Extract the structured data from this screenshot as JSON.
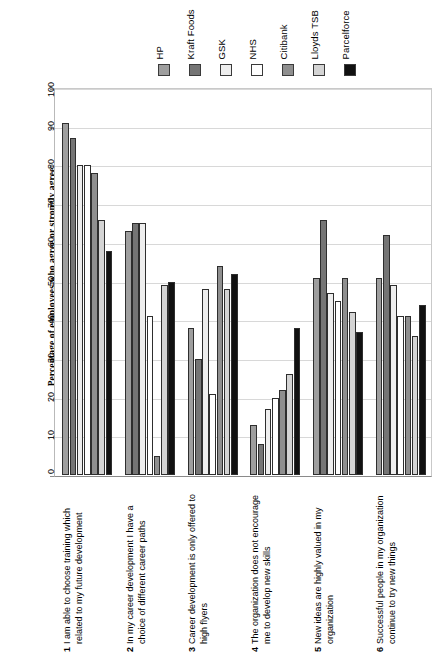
{
  "chart_data": {
    "type": "bar",
    "title": "",
    "xlabel": "",
    "ylabel": "Percentage of employees who agree or strongly agree",
    "ylim": [
      0,
      100
    ],
    "yticks": [
      0,
      10,
      20,
      30,
      40,
      50,
      60,
      70,
      80,
      90,
      100
    ],
    "grid": true,
    "legend_position": "top",
    "orientation": "vertical",
    "grouped": true,
    "categories": [
      "I am able to choose training which related to my future development",
      "In my career development I have a choice of different career paths",
      "Career development is only offered to high flyers",
      "The organization does not encourage me to develop new skills",
      "New ideas are highly valued in my organization",
      "Successful people in my organization continue to try new things"
    ],
    "category_numbers": [
      "1",
      "2",
      "3",
      "4",
      "5",
      "6"
    ],
    "series": [
      {
        "name": "HP",
        "color": "#9e9e9e",
        "values": [
          91,
          63,
          38,
          13,
          51,
          51
        ]
      },
      {
        "name": "Kraft Foods",
        "color": "#757575",
        "values": [
          87,
          65,
          30,
          8,
          66,
          62
        ]
      },
      {
        "name": "GSK",
        "color": "#eeeeee",
        "values": [
          80,
          65,
          48,
          17,
          47,
          49
        ]
      },
      {
        "name": "NHS",
        "color": "#ffffff",
        "values": [
          80,
          41,
          21,
          20,
          45,
          41
        ]
      },
      {
        "name": "Citibank",
        "color": "#8f8f8f",
        "values": [
          78,
          5,
          54,
          22,
          51,
          41
        ]
      },
      {
        "name": "Lloyds TSB",
        "color": "#d4d4d4",
        "values": [
          66,
          49,
          48,
          26,
          42,
          36
        ]
      },
      {
        "name": "Parcelforce",
        "color": "#111111",
        "values": [
          58,
          50,
          52,
          38,
          37,
          44
        ]
      }
    ]
  },
  "legend": {
    "items": [
      {
        "label": "HP",
        "swatch": "#9e9e9e"
      },
      {
        "label": "Kraft Foods",
        "swatch": "#757575"
      },
      {
        "label": "GSK",
        "swatch": "#eeeeee"
      },
      {
        "label": "NHS",
        "swatch": "#ffffff"
      },
      {
        "label": "Citibank",
        "swatch": "#8f8f8f"
      },
      {
        "label": "Lloyds TSB",
        "swatch": "#d4d4d4"
      },
      {
        "label": "Parcelforce",
        "swatch": "#111111"
      }
    ]
  },
  "axes": {
    "y_title": "Percentage of employees who agree or strongly agree",
    "y_tick_labels": [
      "0",
      "10",
      "20",
      "30",
      "40",
      "50",
      "60",
      "70",
      "80",
      "90",
      "100"
    ]
  },
  "colors": {
    "gridline": "#d8d8d8",
    "axis": "#8a8a8a",
    "bar_outline": "#2e2e2e",
    "background": "#ffffff"
  }
}
